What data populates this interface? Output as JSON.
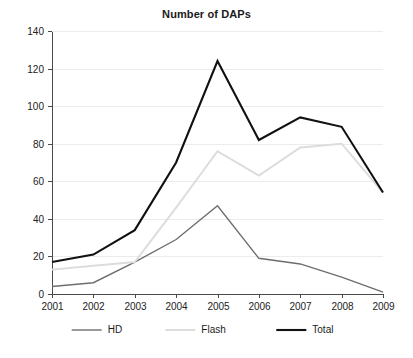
{
  "chart_data": {
    "type": "line",
    "title": "Number of DAPs",
    "xlabel": "",
    "ylabel": "",
    "categories": [
      "2001",
      "2002",
      "2003",
      "2004",
      "2005",
      "2006",
      "2007",
      "2008",
      "2009"
    ],
    "x": [
      2001,
      2002,
      2003,
      2004,
      2005,
      2006,
      2007,
      2008,
      2009
    ],
    "series": [
      {
        "name": "HD",
        "color": "#6e6e6e",
        "width": 1.4,
        "values": [
          4,
          6,
          17,
          29,
          47,
          19,
          16,
          9,
          1
        ]
      },
      {
        "name": "Flash",
        "color": "#dcdcdc",
        "width": 1.9,
        "values": [
          13,
          15,
          17,
          46,
          76,
          63,
          78,
          80,
          54
        ]
      },
      {
        "name": "Total",
        "color": "#111111",
        "width": 2.1,
        "values": [
          17,
          21,
          34,
          70,
          124,
          82,
          94,
          89,
          54
        ]
      }
    ],
    "ylim": [
      0,
      140
    ],
    "yticks": [
      0,
      20,
      40,
      60,
      80,
      100,
      120,
      140
    ],
    "ytick_labels": [
      "0",
      "20",
      "40",
      "60",
      "80",
      "100",
      "120",
      "140"
    ],
    "grid": true,
    "grid_color": "#ececec",
    "legend_position": "bottom",
    "legend": [
      "HD",
      "Flash",
      "Total"
    ],
    "axis_color": "#4a4a4a",
    "background": "#ffffff"
  },
  "layout": {
    "plot_left": 52,
    "plot_right": 383,
    "plot_top": 31,
    "plot_bottom": 294,
    "legend_y": 330
  }
}
